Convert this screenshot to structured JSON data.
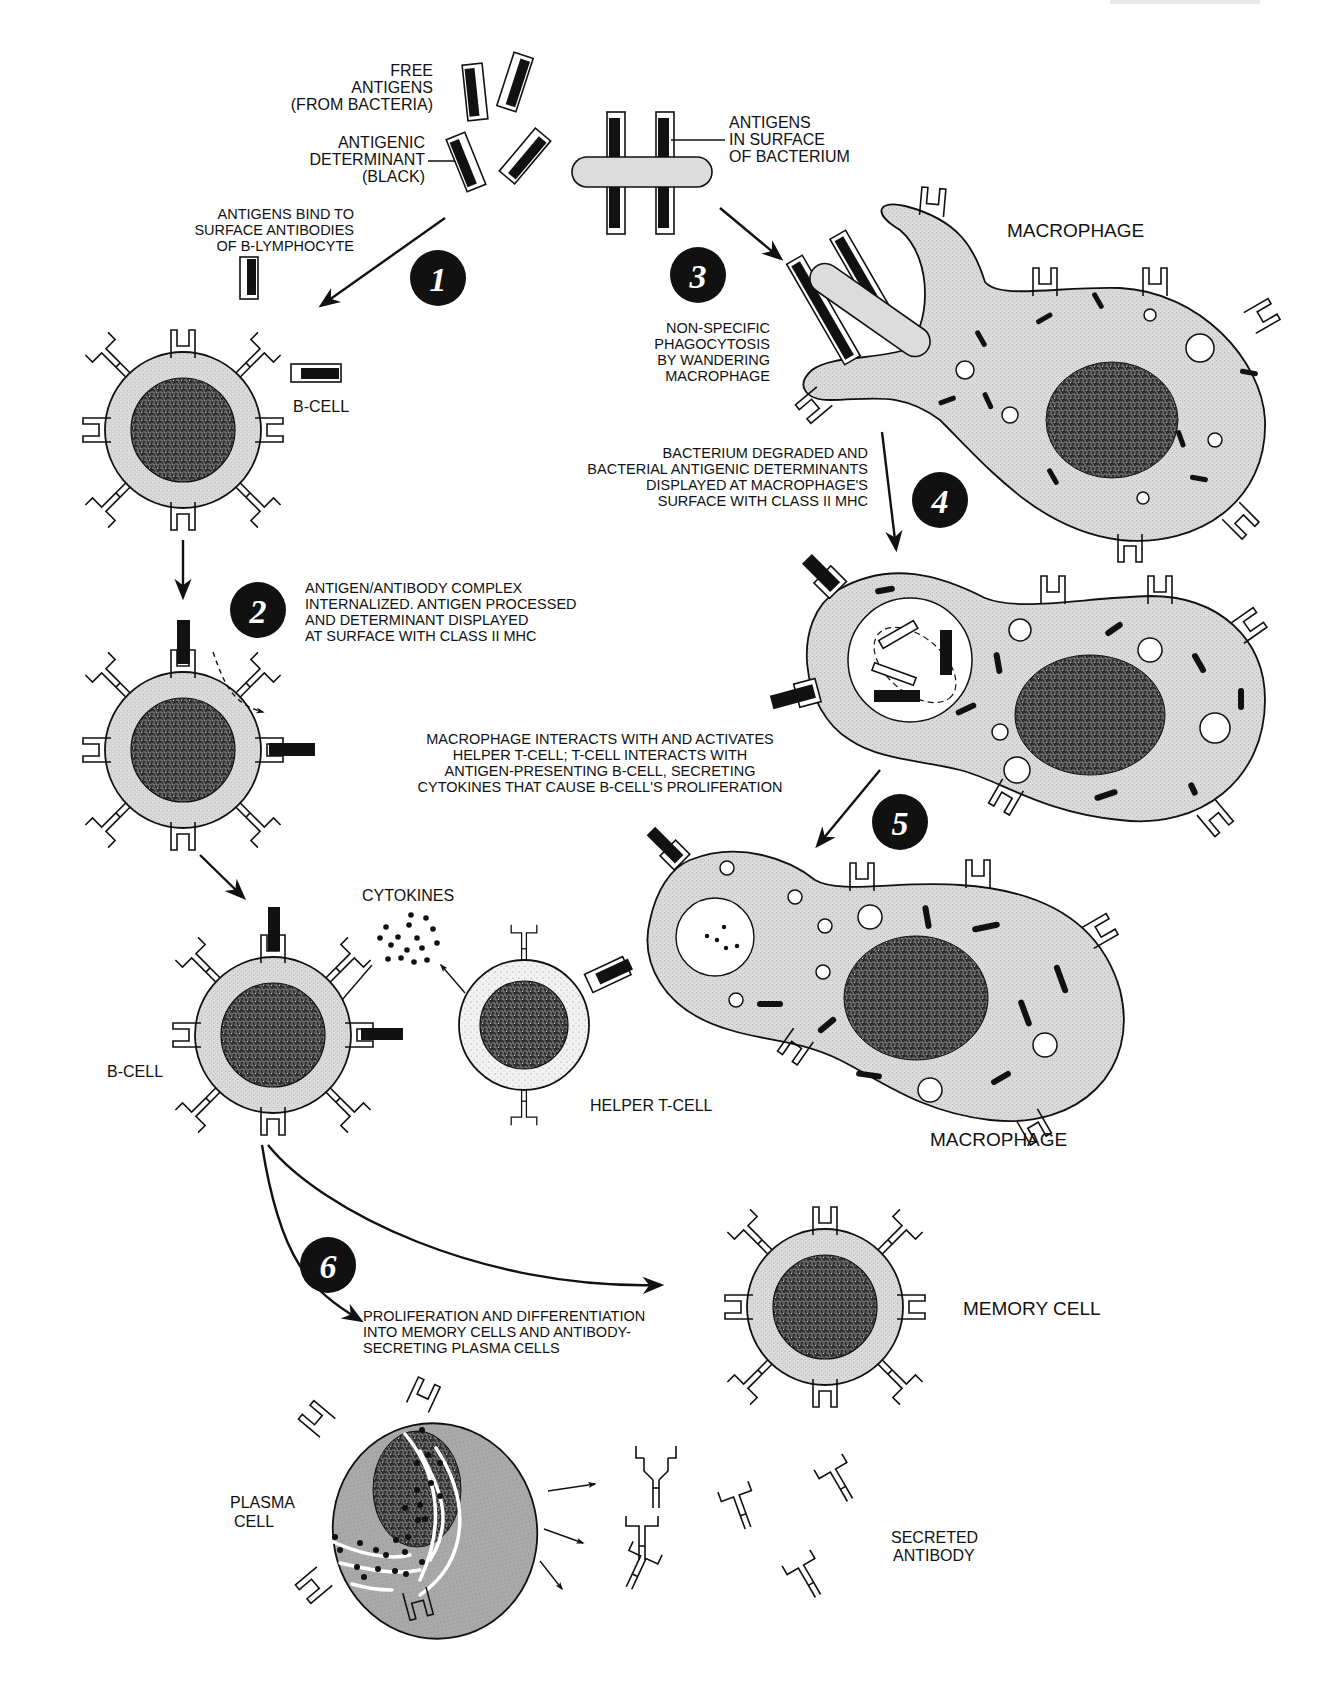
{
  "diagram": {
    "type": "immune-response-flow",
    "colors": {
      "background": "#ffffff",
      "ink": "#111111",
      "cell_cytoplasm": "#d9d9d9",
      "plasma_cytoplasm": "#a8a8a8",
      "tcell_cytoplasm": "#eeeeee",
      "nucleus": "#3a3a3a",
      "step_badge": "#111111"
    },
    "labels": {
      "free_antigens": [
        "FREE",
        "ANTIGENS",
        "(FROM BACTERIA)"
      ],
      "antigenic_determinant": [
        "ANTIGENIC",
        "DETERMINANT",
        "(BLACK)"
      ],
      "antigens_surface": [
        "ANTIGENS",
        "IN SURFACE",
        "OF BACTERIUM"
      ],
      "bind_note": [
        "ANTIGENS BIND TO",
        "SURFACE ANTIBODIES",
        "OF B-LYMPHOCYTE"
      ],
      "macrophage_top": "MACROPHAGE",
      "phagocytosis_note": [
        "NON-SPECIFIC",
        "PHAGOCYTOSIS",
        "BY WANDERING",
        "MACROPHAGE"
      ],
      "b_cell_1": "B-CELL",
      "degraded_note": [
        "BACTERIUM DEGRADED AND",
        "BACTERIAL ANTIGENIC DETERMINANTS",
        "DISPLAYED AT MACROPHAGE'S",
        "SURFACE  WITH CLASS II MHC"
      ],
      "internalized_note": [
        "ANTIGEN/ANTIBODY COMPLEX",
        "INTERNALIZED.  ANTIGEN PROCESSED",
        "AND DETERMINANT DISPLAYED",
        "AT SURFACE WITH CLASS II MHC"
      ],
      "interaction_note": [
        "MACROPHAGE INTERACTS  WITH AND ACTIVATES",
        "HELPER  T-CELL; T-CELL INTERACTS WITH",
        "ANTIGEN-PRESENTING B-CELL, SECRETING",
        "CYTOKINES THAT CAUSE  B-CELL'S PROLIFERATION"
      ],
      "cytokines": "CYTOKINES",
      "b_cell_2": "B-CELL",
      "helper_t_cell": "HELPER T-CELL",
      "macrophage_bottom": "MACROPHAGE",
      "proliferation_note": [
        "PROLIFERATION AND DIFFERENTIATION",
        "INTO MEMORY CELLS AND ANTIBODY-",
        " SECRETING PLASMA CELLS"
      ],
      "memory_cell": "MEMORY CELL",
      "plasma_cell": [
        "PLASMA",
        "CELL"
      ],
      "secreted_antibody": [
        "SECRETED",
        "ANTIBODY"
      ]
    },
    "steps": [
      {
        "number": "1",
        "description": "Antigens bind to surface antibodies of B-lymphocyte"
      },
      {
        "number": "2",
        "description": "Antigen/antibody complex internalized; determinant displayed with class II MHC"
      },
      {
        "number": "3",
        "description": "Non-specific phagocytosis by wandering macrophage"
      },
      {
        "number": "4",
        "description": "Bacterium degraded; determinants displayed at macrophage surface with class II MHC"
      },
      {
        "number": "5",
        "description": "Macrophage activates helper T-cell; T-cell stimulates B-cell via cytokines"
      },
      {
        "number": "6",
        "description": "Proliferation and differentiation into memory cells and plasma cells"
      }
    ]
  }
}
